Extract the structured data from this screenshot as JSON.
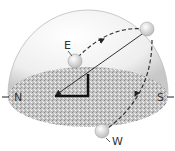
{
  "diagram": {
    "labels": {
      "north": "N",
      "south": "S",
      "east": "E",
      "west": "W"
    },
    "colors": {
      "dome": "#e8e8e8",
      "ground": "#b8b8b8",
      "path": "#333333",
      "sun": "#f0f0f0"
    }
  }
}
